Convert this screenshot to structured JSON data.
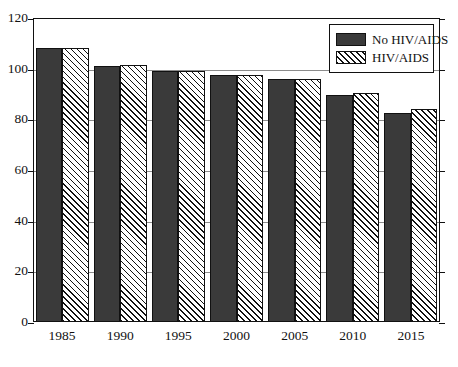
{
  "chart_data": {
    "type": "bar",
    "title": "",
    "xlabel": "",
    "ylabel": "",
    "categories": [
      "1985",
      "1990",
      "1995",
      "2000",
      "2005",
      "2010",
      "2015"
    ],
    "series": [
      {
        "name": "No HIV/AIDS",
        "fill": "solid",
        "color": "#3a3a3a",
        "values": [
          108,
          101,
          99,
          97.5,
          96,
          89.5,
          82.5
        ]
      },
      {
        "name": "HIV/AIDS",
        "fill": "hatch",
        "color": "#ffffff",
        "values": [
          108,
          101.5,
          99,
          97.5,
          96,
          90.5,
          84
        ]
      }
    ],
    "ylim": [
      0,
      120
    ],
    "yticks": [
      0,
      20,
      40,
      60,
      80,
      100,
      120
    ],
    "ytick_labels": [
      "0",
      "20",
      "40",
      "60",
      "80",
      "100",
      "120"
    ],
    "grid": true,
    "legend_position": "upper right",
    "legend_entries": [
      "No HIV/AIDS",
      "HIV/AIDS"
    ]
  }
}
